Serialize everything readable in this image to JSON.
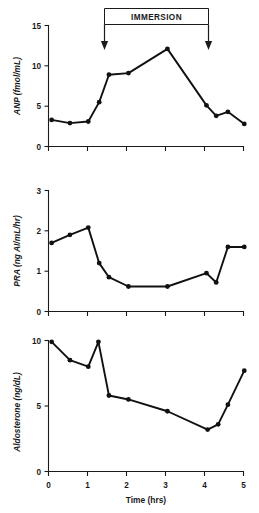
{
  "figure": {
    "annotation": {
      "label": "IMMERSION",
      "start_hr": 1,
      "end_hr": 4
    },
    "x_axis": {
      "label": "Time (hrs)",
      "ticks": [
        0,
        1,
        2,
        3,
        4,
        5
      ],
      "tick_labels": [
        "0",
        "1",
        "2",
        "3",
        "4",
        "5"
      ],
      "min": 0,
      "max": 5
    }
  },
  "chart_data": [
    {
      "type": "line",
      "panel": "anp",
      "title": "",
      "xlabel": "Time (hrs)",
      "ylabel": "ANP (fmol/mL)",
      "xlim": [
        0,
        5
      ],
      "ylim": [
        0,
        15
      ],
      "yticks": [
        0,
        5,
        10,
        15
      ],
      "ytick_labels": [
        "0",
        "5",
        "10",
        "15"
      ],
      "grid": false,
      "legend": "none",
      "x": [
        0.08,
        0.55,
        1.02,
        1.3,
        1.55,
        2.05,
        3.05,
        4.05,
        4.3,
        4.6,
        5.02
      ],
      "values": [
        3.3,
        2.9,
        3.1,
        5.5,
        8.9,
        9.1,
        12.1,
        5.1,
        3.8,
        4.3,
        2.8
      ]
    },
    {
      "type": "line",
      "panel": "pra",
      "title": "",
      "xlabel": "Time (hrs)",
      "ylabel": "PRA (ng AI/mL/hr)",
      "xlim": [
        0,
        5
      ],
      "ylim": [
        0,
        3
      ],
      "yticks": [
        0,
        1,
        2,
        3
      ],
      "ytick_labels": [
        "0",
        "1",
        "2",
        "3"
      ],
      "grid": false,
      "legend": "none",
      "x": [
        0.08,
        0.55,
        1.02,
        1.3,
        1.55,
        2.05,
        3.05,
        4.05,
        4.3,
        4.6,
        5.02
      ],
      "values": [
        1.7,
        1.9,
        2.08,
        1.2,
        0.85,
        0.62,
        0.62,
        0.95,
        0.72,
        1.6,
        1.6
      ]
    },
    {
      "type": "line",
      "panel": "aldosterone",
      "title": "",
      "xlabel": "Time (hrs)",
      "ylabel": "Aldosterone (ng/dL)",
      "xlim": [
        0,
        5
      ],
      "ylim": [
        0,
        10
      ],
      "yticks": [
        0,
        5,
        10
      ],
      "ytick_labels": [
        "0",
        "5",
        "10"
      ],
      "grid": false,
      "legend": "none",
      "x": [
        0.08,
        0.55,
        1.02,
        1.28,
        1.55,
        2.05,
        3.05,
        4.08,
        4.35,
        4.6,
        5.02
      ],
      "values": [
        9.9,
        8.5,
        8.0,
        9.9,
        5.8,
        5.5,
        4.6,
        3.2,
        3.6,
        5.1,
        7.7
      ]
    }
  ]
}
